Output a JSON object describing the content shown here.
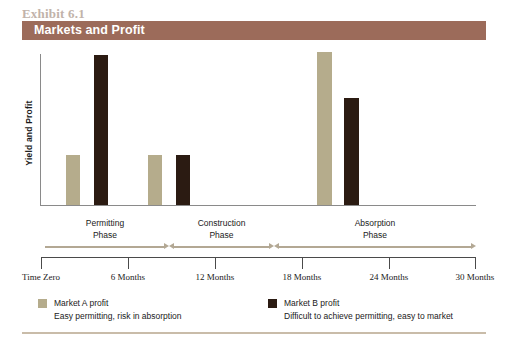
{
  "header": {
    "exhibit_label": "Exhibit 6.1",
    "banner_title": "Markets and Profit",
    "banner_color": "#9C6B5A"
  },
  "axes": {
    "y_title": "Yield and Profit"
  },
  "phases": [
    {
      "line1": "Permitting",
      "line2": "Phase"
    },
    {
      "line1": "Construction",
      "line2": "Phase"
    },
    {
      "line1": "Absorption",
      "line2": "Phase"
    }
  ],
  "timeline": {
    "ticks": [
      "Time Zero",
      "6 Months",
      "12 Months",
      "18 Months",
      "24 Months",
      "30 Months"
    ]
  },
  "legend": [
    {
      "title": "Market A profit",
      "subtitle": "Easy permitting, risk in absorption",
      "color": "#B5AC8C"
    },
    {
      "title": "Market B profit",
      "subtitle": "Difficult to achieve permitting, easy to market",
      "color": "#2B1B12"
    }
  ],
  "chart_data": {
    "type": "bar",
    "title": "Markets and Profit",
    "xlabel": "",
    "ylabel": "Yield and Profit",
    "grid": false,
    "legend_position": "bottom",
    "categories": [
      "Permitting Phase",
      "Construction Phase",
      "Absorption Phase"
    ],
    "x_axis_ticks": [
      "Time Zero",
      "6 Months",
      "12 Months",
      "18 Months",
      "24 Months",
      "30 Months"
    ],
    "ylim": [
      0,
      160
    ],
    "series": [
      {
        "name": "Market A profit",
        "color": "#B5AC8C",
        "values": [
          50,
          50,
          153
        ]
      },
      {
        "name": "Market B profit",
        "color": "#2B1B12",
        "values": [
          150,
          50,
          107
        ]
      }
    ],
    "bars": [
      {
        "series": "Market A profit",
        "category": "Permitting Phase",
        "value": 50,
        "left": 25,
        "width": 14
      },
      {
        "series": "Market B profit",
        "category": "Permitting Phase",
        "value": 150,
        "left": 53,
        "width": 14
      },
      {
        "series": "Market A profit",
        "category": "Construction Phase",
        "value": 50,
        "left": 107,
        "width": 14
      },
      {
        "series": "Market B profit",
        "category": "Construction Phase",
        "value": 50,
        "left": 135,
        "width": 14
      },
      {
        "series": "Market A profit",
        "category": "Absorption Phase",
        "value": 153,
        "left": 276,
        "width": 15
      },
      {
        "series": "Market B profit",
        "category": "Absorption Phase",
        "value": 107,
        "left": 303,
        "width": 15
      }
    ]
  }
}
